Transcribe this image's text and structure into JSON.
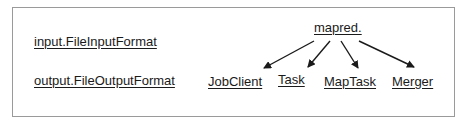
{
  "diagram": {
    "left_labels": [
      {
        "text": "input.FileInputFormat"
      },
      {
        "text": "output.FileOutputFormat"
      }
    ],
    "root": {
      "text": "mapred."
    },
    "children": [
      {
        "text": "JobClient"
      },
      {
        "text": "Task"
      },
      {
        "text": "MapTask"
      },
      {
        "text": "Merger"
      }
    ],
    "colors": {
      "border": "#9a9a9a",
      "text": "#1a1a1a",
      "arrow": "#1a1a1a"
    }
  }
}
